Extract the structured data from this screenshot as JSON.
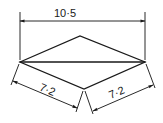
{
  "diagram": {
    "type": "rhombus-dimension-drawing",
    "dimensions": {
      "diagonal": "10·5",
      "side_left": "7·2",
      "side_right": "7·2"
    },
    "vertices": {
      "left": [
        20,
        62
      ],
      "top": [
        80,
        36
      ],
      "right": [
        145,
        62
      ],
      "bottom": [
        84,
        89
      ]
    },
    "colors": {
      "line": "#1a1a1a",
      "background": "#ffffff"
    }
  }
}
